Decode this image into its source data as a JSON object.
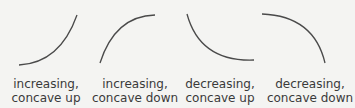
{
  "panels": [
    {
      "line1": "increasing,",
      "line2": "concave up"
    },
    {
      "line1": "increasing,",
      "line2": "concave down"
    },
    {
      "line1": "decreasing,",
      "line2": "concave up"
    },
    {
      "line1": "decreasing,",
      "line2": "concave down"
    }
  ],
  "colors": {
    "curve": "#4a4a4a",
    "text": "#3a3a3a",
    "background": "#f4f4f2"
  }
}
